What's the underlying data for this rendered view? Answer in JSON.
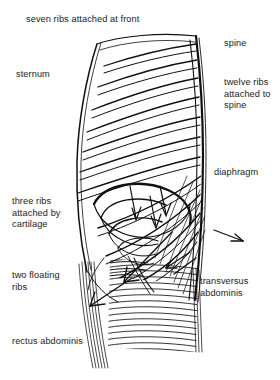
{
  "figure": {
    "type": "anatomical-line-drawing",
    "background_color": "#ffffff",
    "line_color": "#111111",
    "text_color": "#222222"
  },
  "labels": {
    "seven_ribs": "seven ribs attached at front",
    "spine": "spine",
    "sternum": "sternum",
    "twelve_ribs": "twelve ribs attached to spine",
    "diaphragm": "diaphragm",
    "three_ribs": "three ribs attached by cartilage",
    "two_floating_ribs": "two floating ribs",
    "transversus_abdominis": "transversus abdominis",
    "rectus_abdominis": "rectus abdominis"
  },
  "structures": [
    {
      "name": "spine",
      "description": "thick vertical double line forming right border of ribcage"
    },
    {
      "name": "sternum",
      "description": "left front border of ribcage"
    },
    {
      "name": "ribs",
      "count": 12,
      "description": "paired curved lines sweeping down-left from spine"
    },
    {
      "name": "costal-cartilage-ribs",
      "count": 3,
      "description": "lower ribs attached by cartilage"
    },
    {
      "name": "floating-ribs",
      "count": 2,
      "description": "two lowest ribs unattached at front"
    },
    {
      "name": "diaphragm",
      "description": "dome-shaped muscle beneath the lungs"
    },
    {
      "name": "transversus-abdominis",
      "description": "horizontally hatched abdominal muscle sheet"
    },
    {
      "name": "rectus-abdominis",
      "description": "vertical fibre bundles at front of abdomen"
    }
  ]
}
